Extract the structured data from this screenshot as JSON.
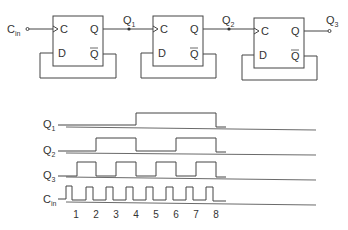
{
  "circuit": {
    "input_label": "C",
    "input_sub": "in",
    "flipflops": [
      {
        "clock_label": "C",
        "d_label": "D",
        "q_label": "Q",
        "qbar_label": "Q"
      },
      {
        "clock_label": "C",
        "d_label": "D",
        "q_label": "Q",
        "qbar_label": "Q"
      },
      {
        "clock_label": "C",
        "d_label": "D",
        "q_label": "Q",
        "qbar_label": "Q"
      }
    ],
    "outputs": [
      {
        "label": "Q",
        "sub": "1"
      },
      {
        "label": "Q",
        "sub": "2"
      },
      {
        "label": "Q",
        "sub": "3"
      }
    ]
  },
  "timing": {
    "signals": [
      {
        "label": "Q",
        "sub": "1"
      },
      {
        "label": "Q",
        "sub": "2"
      },
      {
        "label": "Q",
        "sub": "3"
      },
      {
        "label": "C",
        "sub": "in"
      }
    ],
    "clock_numbers": [
      "1",
      "2",
      "3",
      "4",
      "5",
      "6",
      "7",
      "8"
    ]
  },
  "colors": {
    "line": "#444444",
    "text": "#333333",
    "background": "#ffffff"
  }
}
